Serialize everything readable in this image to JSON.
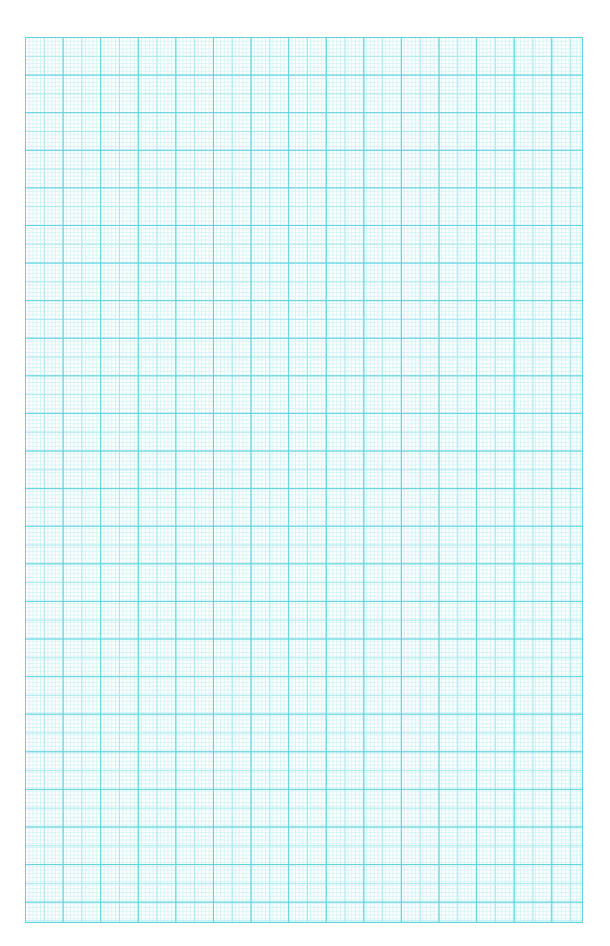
{
  "page": {
    "type": "graph-paper",
    "background_color": "#ffffff",
    "grid": {
      "major_line_color": "#5fd3e0",
      "medium_line_color": "#a8e8ee",
      "minor_line_color": "#d6f4f7",
      "major_spacing_px": 37.6,
      "subdivisions": 10
    }
  }
}
